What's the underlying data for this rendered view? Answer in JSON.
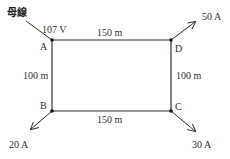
{
  "diagram": {
    "bus_label": "母線",
    "source_voltage": "107 V",
    "nodes": {
      "A": "A",
      "B": "B",
      "C": "C",
      "D": "D"
    },
    "segments": {
      "AD": "150 m",
      "BC": "150 m",
      "AB": "100 m",
      "DC": "100 m"
    },
    "loads": {
      "D": "50 A",
      "B": "20 A",
      "C": "30 A"
    },
    "colors": {
      "line": "#333333",
      "text": "#333333"
    }
  }
}
